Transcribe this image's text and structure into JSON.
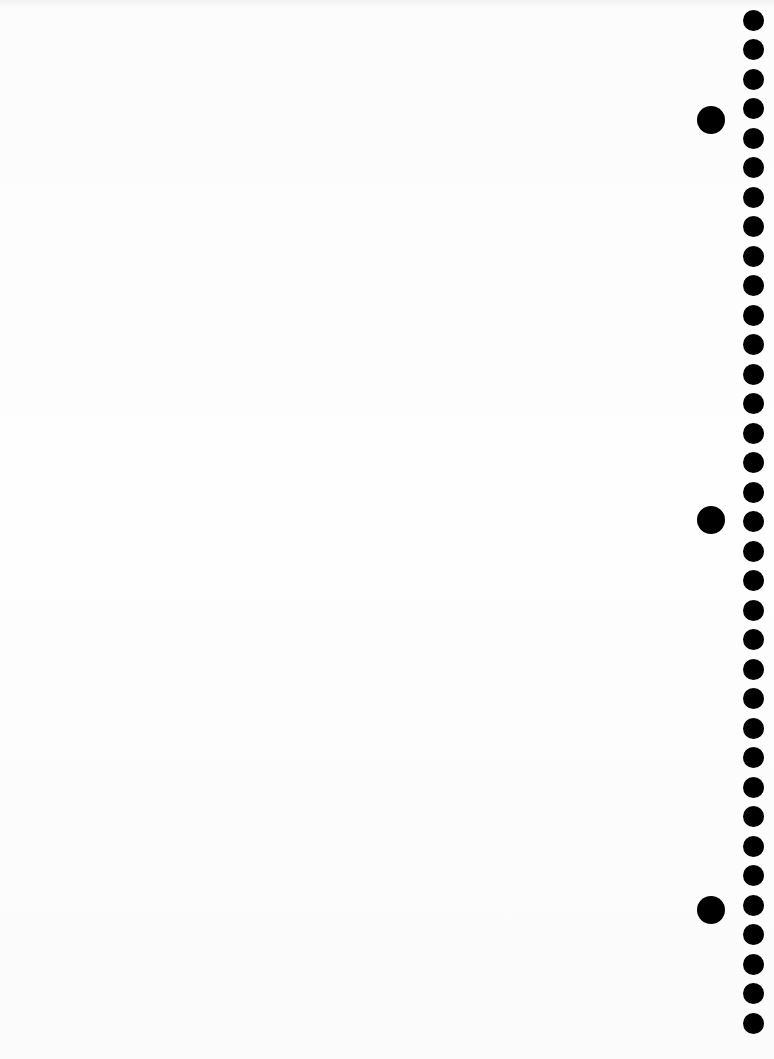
{
  "document": {
    "type": "blank-punched-sheet",
    "content_text": "",
    "background_color": "#fdfdfd",
    "hole_color": "#000000"
  },
  "holes": {
    "small_count": 35,
    "small_first_center_y": 20,
    "small_pitch_px": 29.5,
    "large_centers_y": [
      120,
      520,
      910
    ]
  }
}
